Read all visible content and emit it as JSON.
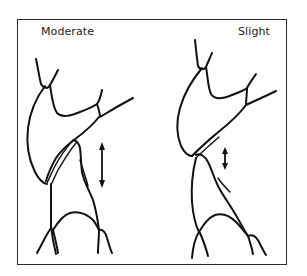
{
  "figure": {
    "panels": [
      {
        "id": "left",
        "label": "Moderate",
        "arrow": "long-double-arrow"
      },
      {
        "id": "right",
        "label": "Slight",
        "arrow": "short-double-arrow"
      }
    ],
    "colors": {
      "line": "#111111",
      "background": "#ffffff",
      "frame": "#2a2a2a"
    }
  }
}
